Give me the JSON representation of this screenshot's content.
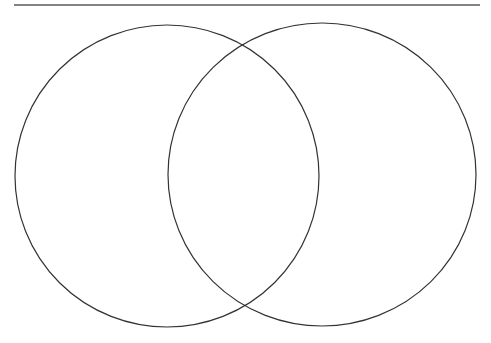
{
  "diagram": {
    "type": "venn",
    "description": "Blank two-circle Venn diagram",
    "header_rule": {
      "x1": 14,
      "x2": 480,
      "y": 5,
      "color": "#5a5a5a",
      "width": 1.5
    },
    "circles": [
      {
        "id": "left",
        "cx": 167,
        "cy": 176,
        "rx": 152,
        "ry": 151,
        "stroke": "#333333",
        "label": ""
      },
      {
        "id": "right",
        "cx": 322,
        "cy": 174.5,
        "rx": 154,
        "ry": 151.5,
        "stroke": "#333333",
        "label": ""
      }
    ],
    "stroke_width": 1.2,
    "background": "#ffffff"
  }
}
